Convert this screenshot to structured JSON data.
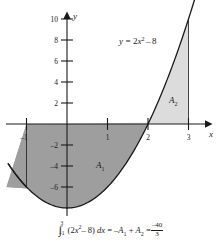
{
  "figure": {
    "title": "",
    "function_label": "y = 2x² – 8",
    "function_label_parts": {
      "lhs": "y",
      "eq": "=",
      "coef": "2",
      "var": "x",
      "power": "2",
      "minus": "–",
      "constant": "8"
    },
    "axis_labels": {
      "x": "x",
      "y": "y"
    },
    "region_labels": {
      "a1": "A",
      "a1_sub": "1",
      "a2": "A",
      "a2_sub": "2"
    },
    "colors": {
      "area_below": "#9e9e9e",
      "area_above": "#dcdcdc",
      "curve": "#1a1a1a",
      "axis": "#1a1a1a",
      "background": "#ffffff",
      "text": "#1a1a1a"
    }
  },
  "caption": {
    "integral_symbol": "∫",
    "lower_limit": "–1",
    "upper_limit": "3",
    "integrand_open": "(2",
    "integrand_var": "x",
    "integrand_power": "2",
    "integrand_minus": "– 8)",
    "differential_d": "d",
    "differential_x": "x",
    "equals1": "=",
    "term1_sign": "–",
    "term1_A": "A",
    "term1_sub": "1",
    "plus": "+",
    "term2_A": "A",
    "term2_sub": "2",
    "equals2": "=",
    "result_numerator": "–40",
    "result_denominator": "3"
  },
  "chart_data": {
    "type": "line",
    "title": "",
    "xlabel": "x",
    "ylabel": "y",
    "function": "y = 2x^2 - 8",
    "xlim": [
      -1.45,
      3.45
    ],
    "ylim": [
      -9.2,
      11.4
    ],
    "xticks": [
      -1,
      1,
      2,
      3
    ],
    "xtick_labels": [
      "–1",
      "1",
      "2",
      "3"
    ],
    "yticks": [
      2,
      4,
      6,
      8,
      10,
      -2,
      -4,
      -6
    ],
    "ytick_labels": [
      "2",
      "4",
      "6",
      "8",
      "10",
      "–2",
      "–4",
      "–6"
    ],
    "grid": false,
    "legend": null,
    "series": [
      {
        "name": "y = 2x² – 8",
        "x": [
          -1.45,
          -1.2,
          -1,
          -0.75,
          -0.5,
          -0.25,
          0,
          0.25,
          0.5,
          0.75,
          1,
          1.25,
          1.5,
          1.75,
          2,
          2.25,
          2.5,
          2.75,
          3,
          3.2,
          3.4,
          3.45
        ],
        "y": [
          -3.8,
          -5.12,
          -6,
          -6.875,
          -7.5,
          -7.875,
          -8,
          -7.875,
          -7.5,
          -6.875,
          -6,
          -4.875,
          -3.5,
          -1.875,
          0,
          2.125,
          4.5,
          7.125,
          10,
          12.48,
          15.12,
          15.8
        ]
      }
    ],
    "shaded_regions": [
      {
        "label": "A1",
        "x_from": -1,
        "x_to": 2,
        "between": "curve and x-axis",
        "position": "below-axis",
        "fill": "#9e9e9e",
        "signed_area": -13.333333,
        "label_position": [
          0.55,
          -4.0
        ]
      },
      {
        "label": "A2",
        "x_from": 2,
        "x_to": 3,
        "between": "curve and x-axis",
        "position": "above-axis",
        "fill": "#dcdcdc",
        "signed_area": 3.333333,
        "label_position": [
          2.65,
          2.3
        ]
      }
    ],
    "annotations": [
      {
        "text": "y = 2x² – 8",
        "x": 1.45,
        "y": 9.1
      },
      {
        "text": "A₁",
        "x": 0.55,
        "y": -4.0
      },
      {
        "text": "A₂",
        "x": 2.65,
        "y": 2.3
      }
    ],
    "integral_value": -13.333333,
    "integral_display": "–40/3"
  }
}
